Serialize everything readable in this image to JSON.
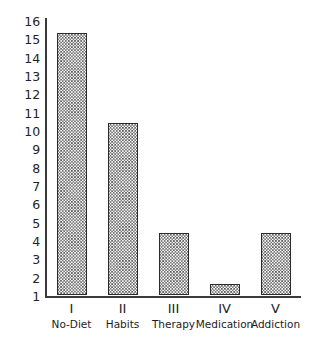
{
  "chart_data": {
    "type": "bar",
    "title": "",
    "xlabel": "",
    "ylabel": "",
    "categories": [
      "I",
      "II",
      "III",
      "IV",
      "V"
    ],
    "category_names": [
      "No-Diet",
      "Habits",
      "Therapy",
      "Medication",
      "Addiction"
    ],
    "values": [
      15.3,
      10.4,
      4.4,
      1.6,
      4.4
    ],
    "ylim": [
      1,
      16
    ],
    "ytick_labels": [
      "16",
      "15",
      "14",
      "13",
      "12",
      "11",
      "10",
      "9",
      "8",
      "7",
      "6",
      "5",
      "4",
      "3",
      "2",
      "1"
    ],
    "ytick_values": [
      16,
      15,
      14,
      13,
      12,
      11,
      10,
      9,
      8,
      7,
      6,
      5,
      4,
      3,
      2,
      1
    ],
    "grid": false,
    "legend": null,
    "series": [
      {
        "name": "",
        "values": [
          15.3,
          10.4,
          4.4,
          1.6,
          4.4
        ]
      }
    ],
    "bar_fill": "crosshatch-pattern",
    "colors": {
      "axis": "#3a3a3a",
      "bar_edge": "#2b2b2b",
      "bar_hatch": "#4c4c4c",
      "background": "#ffffff",
      "text": "#1c1c1c"
    }
  }
}
